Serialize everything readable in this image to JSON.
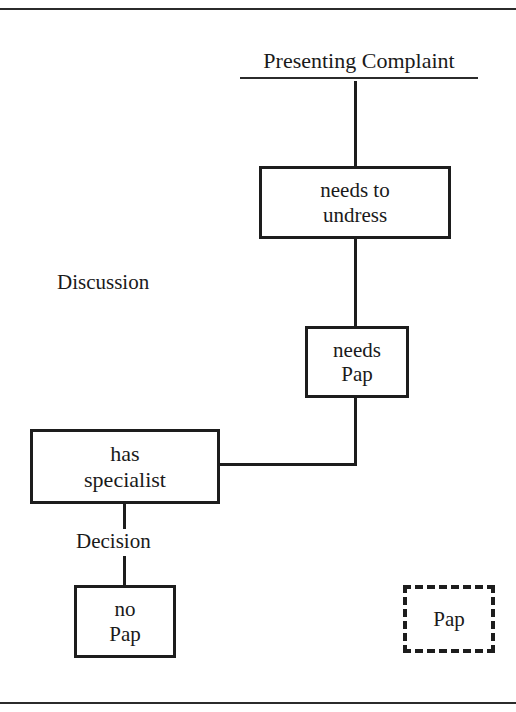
{
  "figure": {
    "heading": "Presenting Complaint",
    "section_labels": {
      "discussion": "Discussion",
      "decision": "Decision"
    }
  },
  "nodes": [
    {
      "id": "needs-to-undress",
      "label": "needs to\nundress",
      "border": "solid"
    },
    {
      "id": "needs-pap",
      "label": "needs\nPap",
      "border": "solid"
    },
    {
      "id": "has-specialist",
      "label": "has\nspecialist",
      "border": "solid"
    },
    {
      "id": "no-pap",
      "label": "no\nPap",
      "border": "solid"
    },
    {
      "id": "pap",
      "label": "Pap",
      "border": "dashed"
    }
  ],
  "colors": {
    "ink": "#1d1d1d",
    "rule": "#2b2b2b",
    "background": "#ffffff"
  }
}
